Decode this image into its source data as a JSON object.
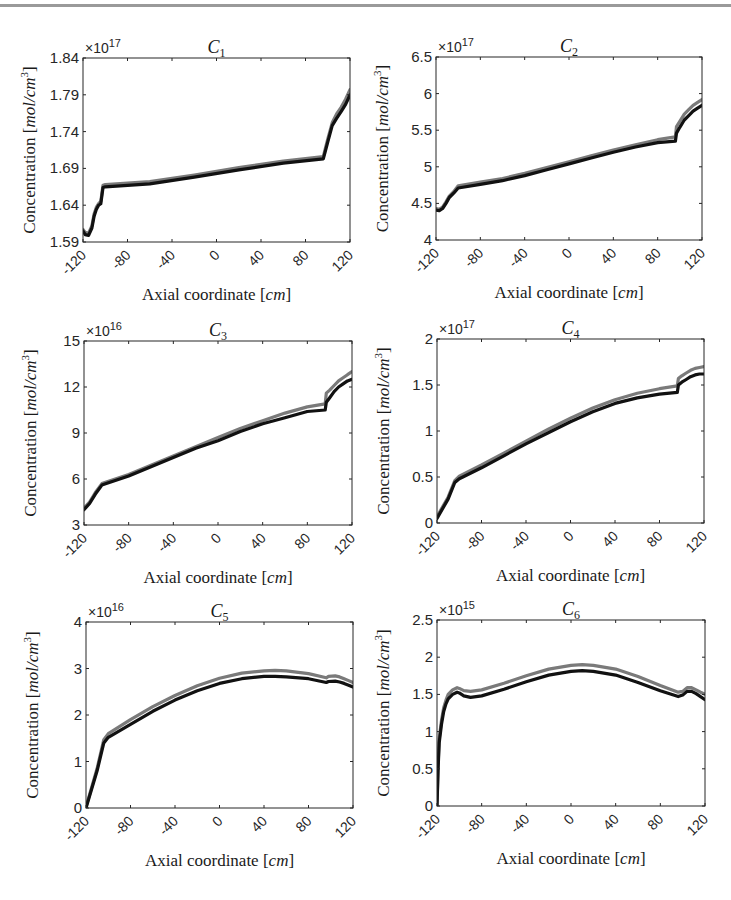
{
  "figure": {
    "top_rule_color": "#9a9a9a",
    "series_colors": {
      "upper": "#7a7a7a",
      "lower": "#111111"
    }
  },
  "chart_data": [
    {
      "type": "line",
      "id": "c1",
      "title": "C1",
      "title_main": "C",
      "title_sub": "1",
      "xlabel": "Axial coordinate [cm]",
      "xlabel_main": "Axial coordinate [",
      "xlabel_unit": "cm",
      "xlabel_close": "]",
      "ylabel": "Concentration [mol/cm^3]",
      "y_exponent": "×10",
      "y_exponent_power": "17",
      "xlim": [
        -120,
        120
      ],
      "ylim": [
        1.59,
        1.84
      ],
      "xticks": [
        -120,
        -80,
        -40,
        0,
        40,
        80,
        120
      ],
      "yticks": [
        1.59,
        1.64,
        1.69,
        1.74,
        1.79,
        1.84
      ],
      "ytick_labels": [
        "1.59",
        "1.64",
        "1.69",
        "1.74",
        "1.79",
        "1.84"
      ],
      "box": {
        "left": 83,
        "top": 58,
        "right": 350,
        "bottom": 242
      },
      "series": [
        {
          "name": "upper (gray)",
          "x": [
            -120,
            -118,
            -115,
            -112,
            -110,
            -108,
            -106,
            -104,
            -102,
            -100,
            -60,
            -20,
            20,
            60,
            96,
            98,
            100,
            104,
            108,
            112,
            116,
            120
          ],
          "y": [
            1.607,
            1.603,
            1.602,
            1.612,
            1.628,
            1.637,
            1.642,
            1.645,
            1.667,
            1.668,
            1.672,
            1.681,
            1.691,
            1.7,
            1.706,
            1.718,
            1.73,
            1.752,
            1.764,
            1.773,
            1.784,
            1.797
          ]
        },
        {
          "name": "lower (black)",
          "x": [
            -120,
            -118,
            -115,
            -112,
            -110,
            -108,
            -106,
            -104,
            -102,
            -100,
            -60,
            -20,
            20,
            60,
            96,
            98,
            100,
            104,
            108,
            112,
            116,
            120
          ],
          "y": [
            1.605,
            1.6,
            1.599,
            1.609,
            1.625,
            1.634,
            1.64,
            1.642,
            1.664,
            1.665,
            1.669,
            1.678,
            1.688,
            1.697,
            1.703,
            1.714,
            1.726,
            1.748,
            1.758,
            1.767,
            1.777,
            1.79
          ]
        }
      ]
    },
    {
      "type": "line",
      "id": "c2",
      "title": "C2",
      "title_main": "C",
      "title_sub": "2",
      "xlabel": "Axial coordinate [cm]",
      "xlabel_main": "Axial coordinate [",
      "xlabel_unit": "cm",
      "xlabel_close": "]",
      "ylabel": "Concentration [mol/cm^3]",
      "y_exponent": "×10",
      "y_exponent_power": "17",
      "xlim": [
        -120,
        120
      ],
      "ylim": [
        4,
        6.5
      ],
      "xticks": [
        -120,
        -80,
        -40,
        0,
        40,
        80,
        120
      ],
      "yticks": [
        4,
        4.5,
        5,
        5.5,
        6,
        6.5
      ],
      "ytick_labels": [
        "4",
        "4.5",
        "5",
        "5.5",
        "6",
        "6.5"
      ],
      "box": {
        "left": 436,
        "top": 57,
        "right": 702,
        "bottom": 240
      },
      "series": [
        {
          "name": "upper (gray)",
          "x": [
            -120,
            -117,
            -114,
            -111,
            -108,
            -104,
            -100,
            -80,
            -60,
            -40,
            -20,
            0,
            20,
            40,
            60,
            80,
            96,
            97,
            100,
            104,
            108,
            112,
            116,
            120
          ],
          "y": [
            4.43,
            4.42,
            4.45,
            4.52,
            4.6,
            4.66,
            4.74,
            4.79,
            4.84,
            4.91,
            4.99,
            5.07,
            5.15,
            5.23,
            5.3,
            5.37,
            5.41,
            5.55,
            5.62,
            5.72,
            5.78,
            5.84,
            5.88,
            5.92
          ]
        },
        {
          "name": "lower (black)",
          "x": [
            -120,
            -117,
            -114,
            -111,
            -108,
            -104,
            -100,
            -80,
            -60,
            -40,
            -20,
            0,
            20,
            40,
            60,
            80,
            96,
            97,
            100,
            104,
            108,
            112,
            116,
            120
          ],
          "y": [
            4.41,
            4.4,
            4.43,
            4.5,
            4.58,
            4.64,
            4.71,
            4.76,
            4.81,
            4.88,
            4.96,
            5.04,
            5.12,
            5.2,
            5.27,
            5.33,
            5.35,
            5.46,
            5.54,
            5.64,
            5.7,
            5.76,
            5.8,
            5.84
          ]
        }
      ]
    },
    {
      "type": "line",
      "id": "c3",
      "title": "C3",
      "title_main": "C",
      "title_sub": "3",
      "xlabel": "Axial coordinate [cm]",
      "xlabel_main": "Axial coordinate [",
      "xlabel_unit": "cm",
      "xlabel_close": "]",
      "ylabel": "Concentration [mol/cm^3]",
      "y_exponent": "×10",
      "y_exponent_power": "16",
      "xlim": [
        -120,
        120
      ],
      "ylim": [
        3,
        15
      ],
      "xticks": [
        -120,
        -80,
        -40,
        0,
        40,
        80,
        120
      ],
      "yticks": [
        3,
        6,
        9,
        12,
        15
      ],
      "ytick_labels": [
        "3",
        "6",
        "9",
        "12",
        "15"
      ],
      "box": {
        "left": 84,
        "top": 341,
        "right": 352,
        "bottom": 525
      },
      "series": [
        {
          "name": "upper (gray)",
          "x": [
            -120,
            -115,
            -110,
            -104,
            -100,
            -80,
            -60,
            -40,
            -20,
            0,
            20,
            40,
            60,
            80,
            96,
            97,
            100,
            104,
            108,
            112,
            116,
            120
          ],
          "y": [
            4.1,
            4.5,
            5.1,
            5.7,
            5.8,
            6.3,
            6.9,
            7.5,
            8.1,
            8.7,
            9.3,
            9.8,
            10.3,
            10.7,
            10.9,
            11.6,
            11.8,
            12.1,
            12.4,
            12.6,
            12.8,
            13.0
          ]
        },
        {
          "name": "lower (black)",
          "x": [
            -120,
            -115,
            -110,
            -104,
            -100,
            -80,
            -60,
            -40,
            -20,
            0,
            20,
            40,
            60,
            80,
            96,
            97,
            100,
            104,
            108,
            112,
            116,
            120
          ],
          "y": [
            4.0,
            4.4,
            5.0,
            5.6,
            5.7,
            6.2,
            6.8,
            7.4,
            8.0,
            8.5,
            9.1,
            9.6,
            10.0,
            10.4,
            10.5,
            11.0,
            11.3,
            11.7,
            12.0,
            12.2,
            12.4,
            12.5
          ]
        }
      ]
    },
    {
      "type": "line",
      "id": "c4",
      "title": "C4",
      "title_main": "C",
      "title_sub": "4",
      "xlabel": "Axial coordinate [cm]",
      "xlabel_main": "Axial coordinate [",
      "xlabel_unit": "cm",
      "xlabel_close": "]",
      "ylabel": "Concentration [mol/cm^3]",
      "y_exponent": "×10",
      "y_exponent_power": "17",
      "xlim": [
        -120,
        120
      ],
      "ylim": [
        0,
        2
      ],
      "xticks": [
        -120,
        -80,
        -40,
        0,
        40,
        80,
        120
      ],
      "yticks": [
        0,
        0.5,
        1,
        1.5,
        2
      ],
      "ytick_labels": [
        "0",
        "0.5",
        "1",
        "1.5",
        "2"
      ],
      "box": {
        "left": 437,
        "top": 339,
        "right": 704,
        "bottom": 523
      },
      "series": [
        {
          "name": "upper (gray)",
          "x": [
            -120,
            -110,
            -104,
            -100,
            -80,
            -60,
            -40,
            -20,
            0,
            20,
            40,
            60,
            80,
            96,
            97,
            100,
            104,
            108,
            112,
            116,
            120
          ],
          "y": [
            0.07,
            0.28,
            0.46,
            0.51,
            0.63,
            0.76,
            0.89,
            1.02,
            1.14,
            1.25,
            1.34,
            1.41,
            1.46,
            1.49,
            1.57,
            1.6,
            1.63,
            1.66,
            1.68,
            1.69,
            1.7
          ]
        },
        {
          "name": "lower (black)",
          "x": [
            -120,
            -110,
            -104,
            -100,
            -80,
            -60,
            -40,
            -20,
            0,
            20,
            40,
            60,
            80,
            96,
            97,
            100,
            104,
            108,
            112,
            116,
            120
          ],
          "y": [
            0.05,
            0.26,
            0.44,
            0.48,
            0.6,
            0.73,
            0.86,
            0.98,
            1.1,
            1.21,
            1.3,
            1.36,
            1.4,
            1.42,
            1.5,
            1.53,
            1.56,
            1.59,
            1.61,
            1.62,
            1.62
          ]
        }
      ]
    },
    {
      "type": "line",
      "id": "c5",
      "title": "C5",
      "title_main": "C",
      "title_sub": "5",
      "xlabel": "Axial coordinate [cm]",
      "xlabel_main": "Axial coordinate [",
      "xlabel_unit": "cm",
      "xlabel_close": "]",
      "ylabel": "Concentration [mol/cm^3]",
      "y_exponent": "×10",
      "y_exponent_power": "16",
      "xlim": [
        -120,
        120
      ],
      "ylim": [
        0,
        4
      ],
      "xticks": [
        -120,
        -80,
        -40,
        0,
        40,
        80,
        120
      ],
      "yticks": [
        0,
        1,
        2,
        3,
        4
      ],
      "ytick_labels": [
        "0",
        "1",
        "2",
        "3",
        "4"
      ],
      "box": {
        "left": 86,
        "top": 622,
        "right": 353,
        "bottom": 808
      },
      "series": [
        {
          "name": "upper (gray)",
          "x": [
            -120,
            -110,
            -104,
            -100,
            -80,
            -60,
            -40,
            -20,
            0,
            20,
            40,
            50,
            60,
            80,
            96,
            98,
            104,
            108,
            112,
            116,
            120
          ],
          "y": [
            0.02,
            0.85,
            1.47,
            1.6,
            1.9,
            2.18,
            2.42,
            2.63,
            2.79,
            2.9,
            2.95,
            2.96,
            2.95,
            2.89,
            2.8,
            2.83,
            2.84,
            2.82,
            2.78,
            2.74,
            2.7
          ]
        },
        {
          "name": "lower (black)",
          "x": [
            -120,
            -110,
            -104,
            -100,
            -80,
            -60,
            -40,
            -20,
            0,
            20,
            40,
            50,
            60,
            80,
            96,
            98,
            104,
            108,
            112,
            116,
            120
          ],
          "y": [
            0.0,
            0.8,
            1.4,
            1.52,
            1.8,
            2.08,
            2.32,
            2.52,
            2.68,
            2.78,
            2.83,
            2.83,
            2.82,
            2.78,
            2.7,
            2.72,
            2.73,
            2.71,
            2.68,
            2.64,
            2.6
          ]
        }
      ]
    },
    {
      "type": "line",
      "id": "c6",
      "title": "C6",
      "title_main": "C",
      "title_sub": "6",
      "xlabel": "Axial coordinate [cm]",
      "xlabel_main": "Axial coordinate [",
      "xlabel_unit": "cm",
      "xlabel_close": "]",
      "ylabel": "Concentration [mol/cm^3]",
      "y_exponent": "×10",
      "y_exponent_power": "15",
      "xlim": [
        -120,
        120
      ],
      "ylim": [
        0,
        2.5
      ],
      "xticks": [
        -120,
        -80,
        -40,
        0,
        40,
        80,
        120
      ],
      "yticks": [
        0,
        0.5,
        1,
        1.5,
        2,
        2.5
      ],
      "ytick_labels": [
        "0",
        "0.5",
        "1",
        "1.5",
        "2",
        "2.5"
      ],
      "box": {
        "left": 437,
        "top": 620,
        "right": 705,
        "bottom": 806
      },
      "series": [
        {
          "name": "upper (gray)",
          "x": [
            -120,
            -119,
            -118,
            -116,
            -114,
            -112,
            -110,
            -106,
            -102,
            -100,
            -96,
            -90,
            -80,
            -60,
            -40,
            -20,
            0,
            10,
            20,
            40,
            60,
            80,
            96,
            100,
            104,
            108,
            112,
            116,
            120
          ],
          "y": [
            0.0,
            0.55,
            0.9,
            1.15,
            1.32,
            1.42,
            1.5,
            1.56,
            1.59,
            1.58,
            1.55,
            1.54,
            1.56,
            1.65,
            1.75,
            1.84,
            1.89,
            1.9,
            1.89,
            1.84,
            1.74,
            1.62,
            1.53,
            1.54,
            1.59,
            1.59,
            1.56,
            1.53,
            1.5
          ]
        },
        {
          "name": "lower (black)",
          "x": [
            -120,
            -119,
            -118,
            -116,
            -114,
            -112,
            -110,
            -106,
            -102,
            -100,
            -96,
            -90,
            -80,
            -60,
            -40,
            -20,
            0,
            10,
            20,
            40,
            60,
            80,
            96,
            100,
            104,
            108,
            112,
            116,
            120
          ],
          "y": [
            0.0,
            0.5,
            0.85,
            1.1,
            1.27,
            1.37,
            1.44,
            1.5,
            1.53,
            1.52,
            1.48,
            1.46,
            1.48,
            1.57,
            1.67,
            1.76,
            1.81,
            1.82,
            1.81,
            1.76,
            1.66,
            1.55,
            1.47,
            1.49,
            1.54,
            1.54,
            1.51,
            1.47,
            1.43
          ]
        }
      ]
    }
  ]
}
